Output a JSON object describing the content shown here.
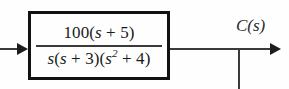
{
  "diagram": {
    "type": "control-system-block-diagram",
    "background_color": "#fefefe",
    "line_color": "#3a3a3a",
    "border_color": "#121212",
    "text_color": "#1a1a1a"
  },
  "input": {
    "label_clipped": ")",
    "full_label_implied": "R(s)",
    "arrow": "arrow-right"
  },
  "block": {
    "name": "transfer-function",
    "numerator": "100(s + 5)",
    "numerator_parts": {
      "coefficient": "100",
      "open_paren": "(",
      "variable": "s",
      "operator": " + ",
      "constant": "5",
      "close_paren": ")"
    },
    "denominator": "s(s + 3)(s² + 4)",
    "denominator_parts": {
      "factor1_variable": "s",
      "factor2": "(s + 3)",
      "factor2_variable": "s",
      "factor2_operator": " + ",
      "factor2_constant": "3",
      "factor3_variable": "s",
      "factor3_exponent": "2",
      "factor3_operator": " + ",
      "factor3_constant": "4"
    },
    "expression": "100(s + 5) / [s(s + 3)(s² + 4)]"
  },
  "output": {
    "label": "C(s)",
    "label_function": "C",
    "label_open_paren": "(",
    "label_variable": "s",
    "label_close_paren": ")",
    "arrow": "arrow-right",
    "has_takeoff_branch": true
  }
}
